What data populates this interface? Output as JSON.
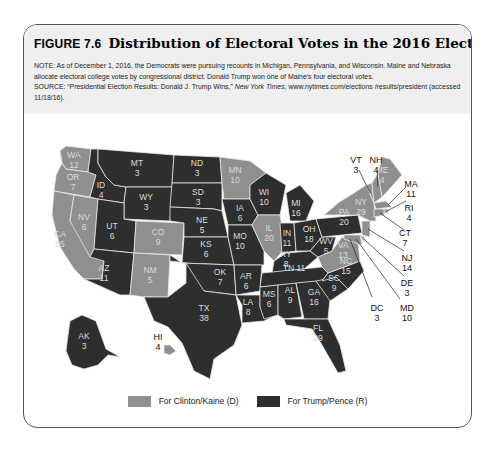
{
  "figure": {
    "label": "FIGURE 7.6",
    "title": "Distribution of Electoral Votes in the 2016 Election",
    "note": "NOTE: As of December 1, 2016, the Democrats were pursuing recounts in Michigan, Pennsylvania, and Wisconsin. Maine and Nebraska allocate electoral college votes by congressional district. Donald Trump won one of Maine's four electoral votes.",
    "source_prefix": "SOURCE: “Presidential Election Results: Donald J. Trump Wins,” ",
    "source_pub": "New York Times",
    "source_suffix": ", www.nytimes.com/elections /results/president (accessed 11/18/16)."
  },
  "colors": {
    "dem": "#8f8f8f",
    "rep": "#2e2e2e",
    "border": "#e6e6e6",
    "header_bg": "#efefef"
  },
  "legend": {
    "dem_label": "For Clinton/Kaine (D)",
    "rep_label": "For Trump/Pence (R)"
  },
  "chart_data": {
    "type": "choropleth-map",
    "title": "Distribution of Electoral Votes in the 2016 Election",
    "legend": [
      {
        "party": "D",
        "label": "For Clinton/Kaine (D)",
        "color": "#8f8f8f"
      },
      {
        "party": "R",
        "label": "For Trump/Pence (R)",
        "color": "#2e2e2e"
      }
    ],
    "states": [
      {
        "state": "WA",
        "votes": 12,
        "party": "D"
      },
      {
        "state": "OR",
        "votes": 7,
        "party": "D"
      },
      {
        "state": "CA",
        "votes": 55,
        "party": "D"
      },
      {
        "state": "NV",
        "votes": 6,
        "party": "D"
      },
      {
        "state": "ID",
        "votes": 4,
        "party": "R"
      },
      {
        "state": "MT",
        "votes": 3,
        "party": "R"
      },
      {
        "state": "WY",
        "votes": 3,
        "party": "R"
      },
      {
        "state": "UT",
        "votes": 6,
        "party": "R"
      },
      {
        "state": "AZ",
        "votes": 11,
        "party": "R"
      },
      {
        "state": "CO",
        "votes": 9,
        "party": "D"
      },
      {
        "state": "NM",
        "votes": 5,
        "party": "D"
      },
      {
        "state": "ND",
        "votes": 3,
        "party": "R"
      },
      {
        "state": "SD",
        "votes": 3,
        "party": "R"
      },
      {
        "state": "NE",
        "votes": 5,
        "party": "R"
      },
      {
        "state": "KS",
        "votes": 6,
        "party": "R"
      },
      {
        "state": "OK",
        "votes": 7,
        "party": "R"
      },
      {
        "state": "TX",
        "votes": 38,
        "party": "R"
      },
      {
        "state": "MN",
        "votes": 10,
        "party": "D"
      },
      {
        "state": "IA",
        "votes": 6,
        "party": "R"
      },
      {
        "state": "MO",
        "votes": 10,
        "party": "R"
      },
      {
        "state": "AR",
        "votes": 6,
        "party": "R"
      },
      {
        "state": "LA",
        "votes": 8,
        "party": "R"
      },
      {
        "state": "WI",
        "votes": 10,
        "party": "R"
      },
      {
        "state": "IL",
        "votes": 20,
        "party": "D"
      },
      {
        "state": "MI",
        "votes": 16,
        "party": "R"
      },
      {
        "state": "IN",
        "votes": 11,
        "party": "R"
      },
      {
        "state": "OH",
        "votes": 18,
        "party": "R"
      },
      {
        "state": "KY",
        "votes": 8,
        "party": "R"
      },
      {
        "state": "TN",
        "votes": 11,
        "party": "R"
      },
      {
        "state": "MS",
        "votes": 6,
        "party": "R"
      },
      {
        "state": "AL",
        "votes": 9,
        "party": "R"
      },
      {
        "state": "GA",
        "votes": 16,
        "party": "R"
      },
      {
        "state": "FL",
        "votes": 29,
        "party": "R"
      },
      {
        "state": "SC",
        "votes": 9,
        "party": "R"
      },
      {
        "state": "NC",
        "votes": 15,
        "party": "R"
      },
      {
        "state": "VA",
        "votes": 13,
        "party": "D"
      },
      {
        "state": "WV",
        "votes": 5,
        "party": "R"
      },
      {
        "state": "PA",
        "votes": 20,
        "party": "R"
      },
      {
        "state": "NY",
        "votes": 29,
        "party": "D"
      },
      {
        "state": "VT",
        "votes": 3,
        "party": "D"
      },
      {
        "state": "NH",
        "votes": 4,
        "party": "D"
      },
      {
        "state": "ME",
        "votes": 4,
        "party": "D",
        "note": "Trump won one of Maine's four electoral votes"
      },
      {
        "state": "MA",
        "votes": 11,
        "party": "D"
      },
      {
        "state": "RI",
        "votes": 4,
        "party": "D"
      },
      {
        "state": "CT",
        "votes": 7,
        "party": "D"
      },
      {
        "state": "NJ",
        "votes": 14,
        "party": "D"
      },
      {
        "state": "DE",
        "votes": 3,
        "party": "D"
      },
      {
        "state": "MD",
        "votes": 10,
        "party": "D"
      },
      {
        "state": "DC",
        "votes": 3,
        "party": "D"
      },
      {
        "state": "AK",
        "votes": 3,
        "party": "R"
      },
      {
        "state": "HI",
        "votes": 4,
        "party": "D"
      }
    ]
  },
  "labels": {
    "WA": [
      "WA",
      "12"
    ],
    "OR": [
      "OR",
      "7"
    ],
    "CA": [
      "CA",
      "55"
    ],
    "NV": [
      "NV",
      "6"
    ],
    "ID": [
      "ID",
      "4"
    ],
    "MT": [
      "MT",
      "3"
    ],
    "WY": [
      "WY",
      "3"
    ],
    "UT": [
      "UT",
      "6"
    ],
    "AZ": [
      "AZ",
      "11"
    ],
    "CO": [
      "CO",
      "9"
    ],
    "NM": [
      "NM",
      "5"
    ],
    "ND": [
      "ND",
      "3"
    ],
    "SD": [
      "SD",
      "3"
    ],
    "NE": [
      "NE",
      "5"
    ],
    "KS": [
      "KS",
      "6"
    ],
    "OK": [
      "OK",
      "7"
    ],
    "TX": [
      "TX",
      "38"
    ],
    "MN": [
      "MN",
      "10"
    ],
    "IA": [
      "IA",
      "6"
    ],
    "MO": [
      "MO",
      "10"
    ],
    "AR": [
      "AR",
      "6"
    ],
    "LA": [
      "LA",
      "8"
    ],
    "WI": [
      "WI",
      "10"
    ],
    "IL": [
      "IL",
      "20"
    ],
    "MI": [
      "MI",
      "16"
    ],
    "IN": [
      "IN",
      "11"
    ],
    "OH": [
      "OH",
      "18"
    ],
    "KY": [
      "KY",
      "8"
    ],
    "TN": [
      "TN 11"
    ],
    "MS": [
      "MS",
      "6"
    ],
    "AL": [
      "AL",
      "9"
    ],
    "GA": [
      "GA",
      "16"
    ],
    "FL": [
      "FL",
      "29"
    ],
    "SC": [
      "SC",
      "9"
    ],
    "NC": [
      "NC",
      "15"
    ],
    "VA": [
      "VA",
      "13"
    ],
    "WV": [
      "WV",
      "5"
    ],
    "PA": [
      "PA",
      "20"
    ],
    "NY": [
      "NY",
      "29"
    ],
    "ME": [
      "ME",
      "4"
    ],
    "VT": [
      "VT",
      "3"
    ],
    "NH": [
      "NH",
      "4"
    ],
    "MA": [
      "MA",
      "11"
    ],
    "RI": [
      "RI",
      "4"
    ],
    "CT": [
      "CT",
      "7"
    ],
    "NJ": [
      "NJ",
      "14"
    ],
    "DE": [
      "DE",
      "3"
    ],
    "MD": [
      "MD",
      "10"
    ],
    "DC": [
      "DC",
      "3"
    ],
    "AK": [
      "AK",
      "3"
    ],
    "HI": [
      "HI",
      "4"
    ]
  }
}
